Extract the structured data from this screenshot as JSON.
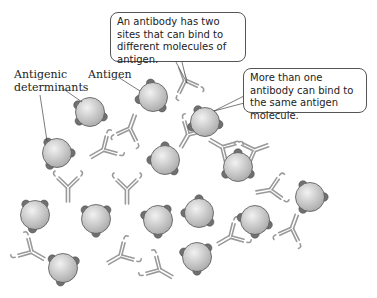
{
  "labels": {
    "antigenic_determinants": "Antigenic\ndeterminants",
    "antigen": "Antigen"
  },
  "callouts": [
    {
      "id": "two-sites",
      "text": "An antibody has two sites that can bind to different molecules of antigen."
    },
    {
      "id": "multiple-antibodies",
      "text": "More than one antibody can bind to the same antigen molecule."
    }
  ],
  "colors": {
    "antigen_fill_center": "#f2f2f2",
    "antigen_fill_edge": "#a8a8a8",
    "antigen_stroke": "#555555",
    "determinant": "#707070",
    "antibody": "#9a9a9a"
  },
  "antigens": [
    {
      "x": 90,
      "y": 112,
      "d": [
        210,
        20,
        140
      ]
    },
    {
      "x": 153,
      "y": 97,
      "d": [
        260,
        50,
        170
      ]
    },
    {
      "x": 205,
      "y": 122,
      "d": [
        240,
        10,
        160
      ]
    },
    {
      "x": 57,
      "y": 153,
      "d": [
        230,
        0,
        120
      ]
    },
    {
      "x": 165,
      "y": 160,
      "d": [
        270,
        50,
        180
      ]
    },
    {
      "x": 238,
      "y": 167,
      "d": [
        270,
        30,
        150
      ]
    },
    {
      "x": 35,
      "y": 215,
      "d": [
        230,
        310,
        100
      ]
    },
    {
      "x": 96,
      "y": 219,
      "d": [
        220,
        320,
        90
      ]
    },
    {
      "x": 158,
      "y": 220,
      "d": [
        200,
        310,
        90
      ]
    },
    {
      "x": 199,
      "y": 213,
      "d": [
        270,
        180,
        40
      ]
    },
    {
      "x": 255,
      "y": 220,
      "d": [
        190,
        20,
        90
      ]
    },
    {
      "x": 310,
      "y": 197,
      "d": [
        240,
        0,
        120
      ]
    },
    {
      "x": 63,
      "y": 268,
      "d": [
        220,
        330,
        100
      ]
    },
    {
      "x": 197,
      "y": 257,
      "d": [
        200,
        320,
        90
      ]
    }
  ],
  "antibodies": [
    {
      "x": 130,
      "y": 128,
      "r": 200
    },
    {
      "x": 103,
      "y": 150,
      "r": 60
    },
    {
      "x": 185,
      "y": 80,
      "r": 160
    },
    {
      "x": 188,
      "y": 135,
      "r": 30
    },
    {
      "x": 222,
      "y": 147,
      "r": 120
    },
    {
      "x": 255,
      "y": 150,
      "r": 250
    },
    {
      "x": 270,
      "y": 190,
      "r": 80
    },
    {
      "x": 68,
      "y": 188,
      "r": 0
    },
    {
      "x": 127,
      "y": 190,
      "r": 0
    },
    {
      "x": 32,
      "y": 252,
      "r": 300
    },
    {
      "x": 120,
      "y": 256,
      "r": 60
    },
    {
      "x": 160,
      "y": 270,
      "r": 300
    },
    {
      "x": 230,
      "y": 237,
      "r": 60
    },
    {
      "x": 292,
      "y": 228,
      "r": 200
    }
  ]
}
